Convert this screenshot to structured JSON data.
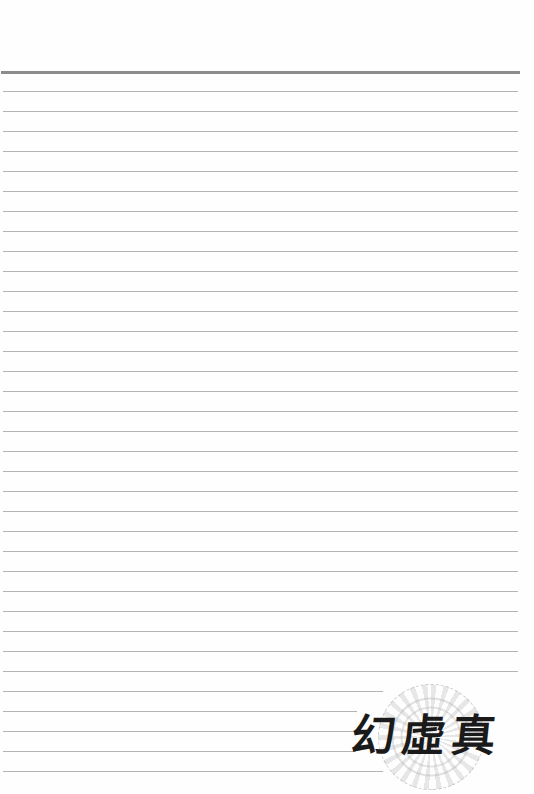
{
  "page": {
    "type": "lined-writing-paper",
    "background": "#fefefe",
    "top_rule": {
      "y": 71,
      "x_start": 1,
      "x_end": 520,
      "thickness": 3,
      "color": "#8c8c8c"
    },
    "line_color": "#b4b4b4",
    "line_spacing": 20,
    "lines": [
      {
        "y": 91,
        "x_end": 518
      },
      {
        "y": 111,
        "x_end": 518
      },
      {
        "y": 131,
        "x_end": 518
      },
      {
        "y": 151,
        "x_end": 518
      },
      {
        "y": 171,
        "x_end": 518
      },
      {
        "y": 191,
        "x_end": 518
      },
      {
        "y": 211,
        "x_end": 518
      },
      {
        "y": 231,
        "x_end": 518
      },
      {
        "y": 251,
        "x_end": 518
      },
      {
        "y": 271,
        "x_end": 518
      },
      {
        "y": 291,
        "x_end": 518
      },
      {
        "y": 311,
        "x_end": 518
      },
      {
        "y": 331,
        "x_end": 518
      },
      {
        "y": 351,
        "x_end": 518
      },
      {
        "y": 371,
        "x_end": 518
      },
      {
        "y": 391,
        "x_end": 518
      },
      {
        "y": 411,
        "x_end": 518
      },
      {
        "y": 431,
        "x_end": 518
      },
      {
        "y": 451,
        "x_end": 518
      },
      {
        "y": 471,
        "x_end": 518
      },
      {
        "y": 491,
        "x_end": 518
      },
      {
        "y": 511,
        "x_end": 518
      },
      {
        "y": 531,
        "x_end": 518
      },
      {
        "y": 551,
        "x_end": 518
      },
      {
        "y": 571,
        "x_end": 518
      },
      {
        "y": 591,
        "x_end": 518
      },
      {
        "y": 611,
        "x_end": 518
      },
      {
        "y": 631,
        "x_end": 518
      },
      {
        "y": 651,
        "x_end": 518
      },
      {
        "y": 671,
        "x_end": 518
      },
      {
        "y": 691,
        "x_end": 383
      },
      {
        "y": 711,
        "x_end": 357
      },
      {
        "y": 731,
        "x_end": 356
      },
      {
        "y": 751,
        "x_end": 356
      },
      {
        "y": 771,
        "x_end": 383
      }
    ]
  },
  "watermark": {
    "characters": [
      "幻",
      "虛",
      "真"
    ],
    "text": "幻虛真",
    "ornament": "decorative-circular-seal",
    "ink_color": "#1a1a1a"
  }
}
